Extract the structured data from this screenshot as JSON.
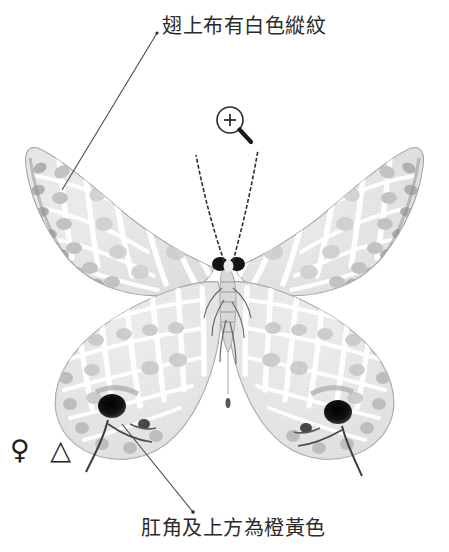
{
  "figure": {
    "kind": "butterfly-specimen-annotated-plate",
    "background_color": "#ffffff",
    "annotations": [
      {
        "id": "top",
        "text": "翅上布有白色縱紋",
        "leader_from": [
          157,
          33
        ],
        "leader_to": [
          62,
          190
        ],
        "points_at": "left-forewing-white-striations"
      },
      {
        "id": "bottom",
        "text": "肛角及上方為橙黃色",
        "leader_from": [
          193,
          512
        ],
        "leader_to": [
          122,
          424
        ],
        "points_at": "left-hindwing-anal-angle-spot"
      }
    ],
    "symbols": {
      "sex": "♀",
      "shape": "△",
      "combined": "♀ △"
    },
    "magnifier": {
      "icon": "magnifier-plus-icon",
      "center": [
        230,
        120
      ],
      "radius": 13,
      "plus": "+"
    },
    "colors": {
      "wing_light": "#ededed",
      "wing_mid": "#d6d6d6",
      "wing_dark": "#b4b4b4",
      "wing_edge": "#8e8e8e",
      "white_band": "#ffffff",
      "anal_spot": "#161616",
      "body": "#cfcfcf",
      "head": "#1a1a1a",
      "leader_line": "#4a4a4a",
      "text": "#2b2b2b"
    },
    "features": {
      "anal_spot_left": [
        112,
        406
      ],
      "anal_spot_right": [
        338,
        412
      ],
      "tail_left_tip": [
        86,
        472
      ],
      "tail_right_tip": [
        362,
        476
      ],
      "antenna_left_tip": [
        196,
        155
      ],
      "antenna_right_tip": [
        258,
        150
      ],
      "body_center": [
        228,
        300
      ],
      "forewing_span": [
        25,
        425
      ],
      "hindwing_span": [
        50,
        400
      ]
    }
  }
}
